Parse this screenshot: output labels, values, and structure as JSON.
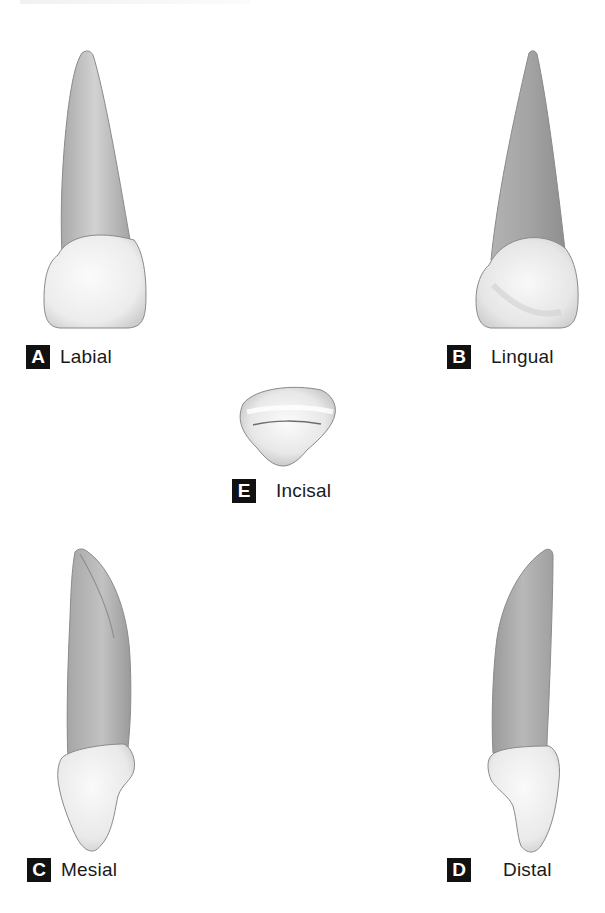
{
  "figure": {
    "colors": {
      "background": "#ffffff",
      "badge_bg": "#111111",
      "badge_text": "#ffffff",
      "crown_light": "#f4f4f4",
      "crown_mid": "#dcdcdc",
      "root_light": "#cfcfcf",
      "root_dark": "#9a9a9a",
      "outline": "#8a8a8a"
    },
    "views": [
      {
        "id": "A",
        "letter": "A",
        "label": "Labial"
      },
      {
        "id": "B",
        "letter": "B",
        "label": "Lingual"
      },
      {
        "id": "E",
        "letter": "E",
        "label": "Incisal"
      },
      {
        "id": "C",
        "letter": "C",
        "label": "Mesial"
      },
      {
        "id": "D",
        "letter": "D",
        "label": "Distal"
      }
    ]
  }
}
